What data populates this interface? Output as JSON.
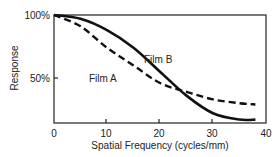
{
  "chart_data": {
    "type": "line",
    "title": "",
    "xlabel": "Spatial Frequency (cycles/mm)",
    "ylabel": "Response",
    "xlim": [
      0,
      40
    ],
    "ylim": [
      14,
      100
    ],
    "x_ticks": [
      "0",
      "10",
      "20",
      "30",
      "40"
    ],
    "y_ticks": [
      "100%",
      "50%"
    ],
    "grid": false,
    "legend": "inline labels",
    "x": [
      0,
      5,
      10,
      15,
      20,
      25,
      30,
      35,
      38
    ],
    "series": [
      {
        "name": "Film A",
        "style": "dashed",
        "values": [
          100,
          91,
          74,
          60,
          46,
          39,
          33,
          30,
          29
        ]
      },
      {
        "name": "Film B",
        "style": "solid",
        "values": [
          100,
          97,
          88,
          74,
          55,
          36,
          22,
          17,
          17
        ]
      }
    ]
  },
  "labels": {
    "film_a": "Film A",
    "film_b": "Film B",
    "ylabel": "Response",
    "xlabel": "Spatial Frequency (cycles/mm)",
    "y100": "100%",
    "y50": "50%",
    "x0": "0",
    "x10": "10",
    "x20": "20",
    "x30": "30",
    "x40": "40"
  }
}
